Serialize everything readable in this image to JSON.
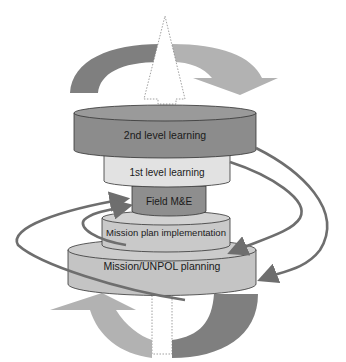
{
  "diagram": {
    "type": "stacked-cylinder learning loop",
    "layers": [
      {
        "id": "second-level",
        "label": "2nd level learning",
        "color": "#8c8c8c"
      },
      {
        "id": "first-level",
        "label": "1st level learning",
        "color": "#e2e2e2"
      },
      {
        "id": "field-me",
        "label": "Field M&E",
        "color": "#8e8e8e"
      },
      {
        "id": "implementation",
        "label": "Mission plan implementation",
        "color": "#c9c9c9"
      },
      {
        "id": "planning",
        "label": "Mission/UNPOL planning",
        "color": "#c4c4c4"
      }
    ],
    "connectors": [
      {
        "from": "2nd level learning",
        "to": "Mission/UNPOL planning",
        "side": "right"
      },
      {
        "from": "1st level learning",
        "to": "Mission plan implementation",
        "side": "right"
      },
      {
        "from": "Mission/UNPOL planning",
        "to": "Field M&E",
        "side": "left"
      },
      {
        "from": "Mission plan implementation",
        "to": "Field M&E",
        "side": "left"
      }
    ],
    "colors": {
      "arrow_dark": "#7a7a7a",
      "arrow_light": "#b0b0b0",
      "connector": "#6e6e6e",
      "outline": "#333333"
    }
  }
}
